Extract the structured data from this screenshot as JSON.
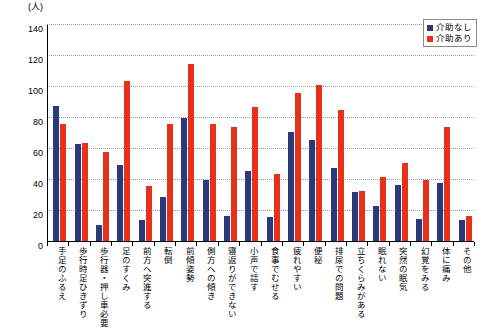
{
  "axis": {
    "unit_label": "(人)",
    "y_ticks": [
      "0",
      "20",
      "40",
      "60",
      "80",
      "100",
      "120",
      "140"
    ]
  },
  "legend": {
    "items": [
      {
        "label": "介助なし",
        "color": "#2b3a7a"
      },
      {
        "label": "介助あり",
        "color": "#e8311c"
      }
    ]
  },
  "chart_data": {
    "type": "bar",
    "title": "",
    "xlabel": "",
    "ylabel": "(人)",
    "ylim": [
      0,
      140
    ],
    "ytick_step": 20,
    "grid": true,
    "legend_position": "top-right",
    "categories": [
      "手足のふるえ",
      "歩行時足ひきずり",
      "歩行器・押し車必要",
      "足のすくみ",
      "前方へ突進する",
      "転倒",
      "前傾姿勢",
      "側方への傾き",
      "寝返りができない",
      "小声で話す",
      "食事でむせる",
      "疲れやすい",
      "便秘",
      "排尿での問題",
      "立ちくらみがある",
      "眠れない",
      "突然の眠気",
      "幻覚をみる",
      "体に痛み",
      "その他"
    ],
    "series": [
      {
        "name": "介助なし",
        "color": "#2b3a7a",
        "values": [
          88,
          63,
          11,
          50,
          14,
          29,
          80,
          40,
          17,
          46,
          16,
          71,
          66,
          48,
          32,
          23,
          37,
          15,
          38,
          14
        ]
      },
      {
        "name": "介助あり",
        "color": "#e8311c",
        "values": [
          76,
          64,
          58,
          104,
          36,
          76,
          115,
          76,
          74,
          87,
          44,
          96,
          101,
          85,
          33,
          42,
          51,
          40,
          74,
          17
        ]
      }
    ]
  }
}
